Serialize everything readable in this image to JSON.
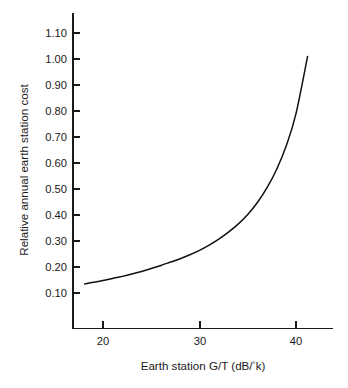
{
  "chart_data": {
    "type": "line",
    "title": "",
    "subtitle": "",
    "xlabel": "Earth station G/T (dB/°k)",
    "ylabel": "Relative annual earth station cost",
    "xlim": [
      17.0,
      44.0
    ],
    "ylim": [
      0.055,
      1.16
    ],
    "grid": false,
    "legend": null,
    "legend_position": "none",
    "xticks": [
      20,
      30,
      40
    ],
    "xtick_labels": [
      "20",
      "30",
      "40"
    ],
    "yticks": [
      0.1,
      0.2,
      0.3,
      0.4,
      0.5,
      0.6,
      0.7,
      0.8,
      0.9,
      1.0,
      1.1
    ],
    "ytick_labels": [
      "0.10",
      "0.20",
      "0.30",
      "0.40",
      "0.50",
      "0.60",
      "0.70",
      "0.80",
      "0.90",
      "1.00",
      "1.10"
    ],
    "series": [
      {
        "name": "Relative annual earth station cost",
        "color": "#111111",
        "x": [
          18.1,
          19.0,
          20.0,
          21.0,
          22.0,
          23.0,
          24.0,
          25.0,
          26.0,
          27.0,
          28.0,
          29.0,
          30.0,
          31.0,
          32.0,
          33.0,
          34.0,
          35.0,
          36.0,
          37.0,
          38.0,
          39.0,
          40.0,
          41.2
        ],
        "y": [
          0.135,
          0.141,
          0.148,
          0.156,
          0.164,
          0.173,
          0.183,
          0.194,
          0.206,
          0.219,
          0.232,
          0.247,
          0.264,
          0.284,
          0.307,
          0.334,
          0.365,
          0.402,
          0.448,
          0.505,
          0.576,
          0.667,
          0.79,
          1.01
        ]
      }
    ]
  },
  "axes": {
    "x_title_prefix": "Earth station G/T (dB/",
    "x_title_degree": "°",
    "x_title_suffix": "k)",
    "y_title": "Relative annual earth station cost"
  },
  "colors": {
    "curve": "#111111",
    "axis": "#1a1a1a",
    "background": "#ffffff"
  }
}
